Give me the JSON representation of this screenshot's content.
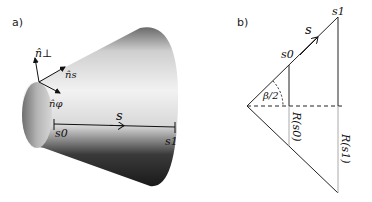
{
  "panel_a": {
    "label": "a)",
    "vectors": {
      "n_perp": "n̂⊥",
      "n_s": "n̂s",
      "n_phi": "n̂φ"
    },
    "arc_label": "s",
    "start_label": "s0",
    "end_label": "s1"
  },
  "panel_b": {
    "label": "b)",
    "arc_label": "s",
    "s0_label": "s0",
    "s1_label": "s1",
    "angle_label": "β/2",
    "r0_label": "R(s0)",
    "r1_label": "R(s1)"
  },
  "colors": {
    "line": "#222222",
    "light_line": "#aaaaaa"
  }
}
